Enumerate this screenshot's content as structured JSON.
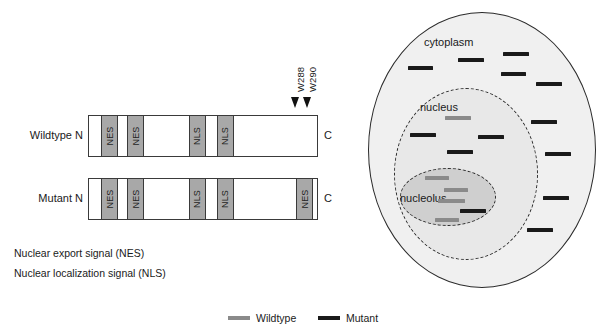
{
  "colors": {
    "wildtype_dash": "#8a8a8a",
    "mutant_dash": "#1a1a1a",
    "domain_fill": "#a8a8a8",
    "cell_fill": "#f0f0f0",
    "nucleus_fill": "#e8e8e8",
    "nucleolus_fill": "#cfcfcf",
    "outline": "#2b2b2b"
  },
  "proteins": [
    {
      "label": "Wildtype",
      "n_terminus": "N",
      "c_terminus": "C",
      "bar": {
        "x": 88,
        "y": 115,
        "width": 230,
        "height": 42
      },
      "domains": [
        {
          "name": "NES",
          "x": 12,
          "width": 17
        },
        {
          "name": "NES",
          "x": 38,
          "width": 17
        },
        {
          "name": "NLS",
          "x": 100,
          "width": 17
        },
        {
          "name": "NLS",
          "x": 128,
          "width": 17
        }
      ]
    },
    {
      "label": "Mutant",
      "n_terminus": "N",
      "c_terminus": "C",
      "bar": {
        "x": 88,
        "y": 178,
        "width": 230,
        "height": 42
      },
      "domains": [
        {
          "name": "NES",
          "x": 12,
          "width": 17
        },
        {
          "name": "NES",
          "x": 38,
          "width": 17
        },
        {
          "name": "NLS",
          "x": 100,
          "width": 17
        },
        {
          "name": "NLS",
          "x": 128,
          "width": 17
        },
        {
          "name": "NES",
          "x": 207,
          "width": 17
        }
      ]
    }
  ],
  "residue_markers": [
    {
      "label": "W288",
      "label_x": 295,
      "label_y": 92,
      "arrow_x": 291,
      "arrow_y": 97
    },
    {
      "label": "W290",
      "label_x": 307,
      "label_y": 92,
      "arrow_x": 303,
      "arrow_y": 97
    }
  ],
  "key": {
    "lines": [
      "Nuclear export signal (NES)",
      "Nuclear localization signal (NLS)"
    ]
  },
  "cell": {
    "outer": {
      "x": 368,
      "y": 12,
      "width": 228,
      "height": 276
    },
    "nucleus": {
      "x": 394,
      "y": 88,
      "width": 144,
      "height": 172
    },
    "nucleolus": {
      "x": 400,
      "y": 168,
      "width": 96,
      "height": 58
    },
    "labels": {
      "cytoplasm": {
        "text": "cytoplasm",
        "x": 424,
        "y": 36
      },
      "nucleus": {
        "text": "nucleus",
        "x": 420,
        "y": 101
      },
      "nucleolus": {
        "text": "nucleolus",
        "x": 400,
        "y": 192
      }
    },
    "dashes": [
      {
        "type": "mutant",
        "x": 408,
        "y": 66,
        "width": 25
      },
      {
        "type": "mutant",
        "x": 458,
        "y": 58,
        "width": 26
      },
      {
        "type": "mutant",
        "x": 503,
        "y": 52,
        "width": 26
      },
      {
        "type": "mutant",
        "x": 501,
        "y": 72,
        "width": 25
      },
      {
        "type": "mutant",
        "x": 536,
        "y": 82,
        "width": 26
      },
      {
        "type": "mutant",
        "x": 531,
        "y": 120,
        "width": 26
      },
      {
        "type": "mutant",
        "x": 545,
        "y": 152,
        "width": 26
      },
      {
        "type": "mutant",
        "x": 543,
        "y": 196,
        "width": 26
      },
      {
        "type": "mutant",
        "x": 527,
        "y": 228,
        "width": 26
      },
      {
        "type": "wildtype",
        "x": 445,
        "y": 116,
        "width": 26
      },
      {
        "type": "mutant",
        "x": 410,
        "y": 133,
        "width": 26
      },
      {
        "type": "mutant",
        "x": 478,
        "y": 135,
        "width": 26
      },
      {
        "type": "mutant",
        "x": 447,
        "y": 150,
        "width": 26
      },
      {
        "type": "wildtype",
        "x": 425,
        "y": 176,
        "width": 24
      },
      {
        "type": "wildtype",
        "x": 444,
        "y": 188,
        "width": 24
      },
      {
        "type": "wildtype",
        "x": 438,
        "y": 199,
        "width": 27
      },
      {
        "type": "mutant",
        "x": 460,
        "y": 209,
        "width": 26
      },
      {
        "type": "wildtype",
        "x": 435,
        "y": 218,
        "width": 24
      }
    ]
  },
  "legend": {
    "items": [
      {
        "label": "Wildtype",
        "type": "wildtype",
        "x": 228,
        "y": 308
      },
      {
        "label": "Mutant",
        "type": "mutant",
        "x": 318,
        "y": 308
      }
    ]
  }
}
